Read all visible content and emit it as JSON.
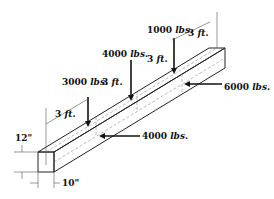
{
  "figure": {
    "cross_section": {
      "height": "12\"",
      "width": "10\""
    },
    "vertical_loads": [
      {
        "value": "3000",
        "unit": "lbs."
      },
      {
        "value": "4000",
        "unit": "lbs."
      },
      {
        "value": "1000",
        "unit": "lbs."
      }
    ],
    "horizontal_loads": [
      {
        "value": "6000",
        "unit": "lbs."
      },
      {
        "value": "4000",
        "unit": "lbs."
      }
    ],
    "spacings": [
      {
        "value": "3",
        "unit": "ft."
      },
      {
        "value": "3",
        "unit": "ft."
      },
      {
        "value": "3",
        "unit": "ft."
      },
      {
        "value": "3",
        "unit": "ft."
      }
    ]
  }
}
